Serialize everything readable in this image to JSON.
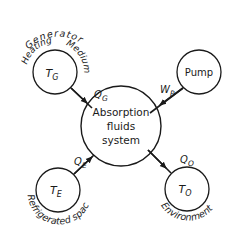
{
  "diagram": {
    "center": {
      "line1": "Absorption",
      "line2": "fluids",
      "line3": "system"
    },
    "nodes": {
      "generator": {
        "symbol": "T",
        "subscript": "G"
      },
      "pump": {
        "label": "Pump"
      },
      "evaporator": {
        "symbol": "T",
        "subscript": "E"
      },
      "environment": {
        "symbol": "T",
        "subscript": "O"
      }
    },
    "flows": {
      "heat_generator": {
        "symbol": "Q",
        "subscript": "G"
      },
      "work_pump": {
        "symbol": "W",
        "subscript": "P"
      },
      "heat_evaporator": {
        "symbol": "Q",
        "subscript": "E"
      },
      "heat_environment": {
        "symbol": "Q",
        "subscript": "O"
      }
    },
    "captions": {
      "generator_top": "Generator",
      "generator_left": "Heating",
      "generator_right": "Medium",
      "evaporator": "Refrigerated space",
      "environment": "Environment"
    },
    "colors": {
      "stroke": "#1a1a1a",
      "background": "#ffffff"
    }
  }
}
